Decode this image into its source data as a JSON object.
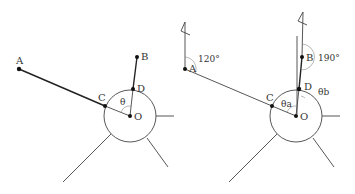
{
  "figures": [
    {
      "id": "left",
      "points": {
        "A": {
          "label": "A",
          "x": 19,
          "y": 69
        },
        "B": {
          "label": "B",
          "x": 137,
          "y": 57
        },
        "C": {
          "label": "C",
          "x": 105,
          "y": 106
        },
        "D": {
          "label": "D",
          "x": 133,
          "y": 89
        },
        "O": {
          "label": "O",
          "x": 130,
          "y": 116
        }
      },
      "angle_label": "θ",
      "circle_radius": 26
    },
    {
      "id": "right",
      "points": {
        "A": {
          "label": "A",
          "x": 185,
          "y": 69
        },
        "B": {
          "label": "B",
          "x": 302,
          "y": 57
        },
        "C": {
          "label": "C",
          "x": 272,
          "y": 106
        },
        "D": {
          "label": "D",
          "x": 299,
          "y": 89
        },
        "O": {
          "label": "O",
          "x": 296,
          "y": 116
        }
      },
      "angle_label_a": "θa",
      "angle_label_b": "θb",
      "bearing_A": "120°",
      "bearing_B": "190°",
      "circle_radius": 26
    }
  ],
  "colors": {
    "line": "#222222",
    "thin_line": "#444444",
    "text": "#333333",
    "background": "#ffffff"
  }
}
